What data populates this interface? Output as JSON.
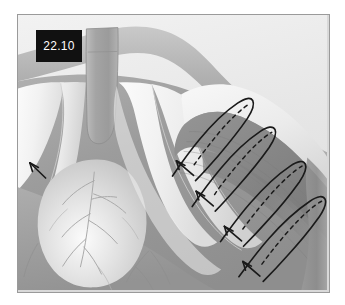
{
  "figure": {
    "label": "22.10",
    "alt_name": "thoracic-anatomy-suture-illustration",
    "frame": {
      "x": 17,
      "y": 14,
      "width": 311,
      "height": 277,
      "border_color": "#9a9a9a"
    },
    "palette": {
      "background": "#ffffff",
      "field_light": "#ececec",
      "field_mid": "#cfcfcf",
      "field_dark": "#9d9d9d",
      "muscle_dark": "#8d8d8d",
      "muscle_darker": "#7e7e7e",
      "bone_white": "#f7f7f7",
      "bone_shadow": "#d2d2d2",
      "heart_light": "#e8e8e8",
      "heart_mid": "#bdbdbd",
      "vessel_line": "#a6a6a6",
      "suture_ink": "#1a1a1a",
      "label_bg": "#111111",
      "label_fg": "#ffffff"
    },
    "structures": [
      {
        "name": "clavicle-manubrium-band",
        "tone": "#b4b4b4"
      },
      {
        "name": "sternum-body",
        "tone": "#ababab"
      },
      {
        "name": "costal-cartilage-left",
        "tone": "#f7f7f7"
      },
      {
        "name": "costal-cartilage-right",
        "tone": "#f4f4f4"
      },
      {
        "name": "heart-silhouette",
        "tone": "#d6d6d6"
      },
      {
        "name": "coronary-vessels",
        "tone": "#a6a6a6"
      },
      {
        "name": "intercostal-muscle-field",
        "tone": "#8d8d8d"
      }
    ],
    "sutures": [
      {
        "name": "suture-loop-1",
        "solid": "M 531 480 L 546 443 C 552 428 561 409 573 392 C 586 373 601 355 615 340 C 634 320 655 302 672 292 C 685 284 694 282 698 287 C 702 292 700 302 692 315 C 683 330 668 350 651 370 C 634 390 617 409 602 424 C 588 438 576 449 566 456",
        "dashed": "M 556 478 C 562 462 572 440 585 420 C 600 397 619 373 637 353 C 655 333 672 317 684 308",
        "arrow": {
          "x": 498,
          "y": 443,
          "rot": -40
        }
      },
      {
        "name": "suture-loop-2",
        "solid": "M 595 568 L 610 532 C 617 515 628 494 642 474 C 657 452 674 431 690 414 C 708 395 726 379 740 370 C 752 363 760 362 763 367 C 767 373 764 384 755 398 C 745 414 729 434 711 455 C 693 476 675 495 659 511 C 645 525 633 535 623 542",
        "dashed": "M 620 566 C 627 549 638 527 652 506 C 668 482 688 457 707 436 C 726 415 743 398 755 389",
        "arrow": {
          "x": 544,
          "y": 531,
          "rot": -40
        }
      },
      {
        "name": "suture-loop-3",
        "solid": "M 680 672 L 696 634 C 703 617 715 595 730 574 C 746 551 764 529 781 511 C 800 491 819 474 834 465 C 847 457 855 456 858 462 C 862 468 859 480 849 495 C 839 511 822 532 803 554 C 784 576 765 596 748 613 C 733 628 720 639 710 646",
        "dashed": "M 706 670 C 713 652 725 629 740 607 C 757 581 778 555 798 533 C 818 511 836 493 849 484",
        "arrow": {
          "x": 628,
          "y": 633,
          "rot": -40
        }
      },
      {
        "name": "suture-loop-4",
        "solid": "M 735 770 L 752 732 C 759 715 771 693 786 672 C 802 649 821 627 838 609 C 857 589 877 572 892 563 C 905 555 913 554 916 560 C 920 566 917 578 907 593 C 897 609 880 631 860 653 C 841 675 822 695 805 712 C 790 727 777 738 767 745",
        "dashed": "M 762 768 C 769 750 781 727 797 705 C 814 679 835 653 856 631 C 876 609 895 591 908 582 ",
        "arrow": {
          "x": 684,
          "y": 731,
          "rot": -40
        }
      }
    ],
    "arrow_markers": [
      {
        "name": "arrow-marker-left-costal",
        "x": 48,
        "y": 449,
        "rot": -30,
        "tail": 46
      },
      {
        "name": "arrow-marker-suture-1",
        "x": 498,
        "y": 443,
        "rot": -40,
        "tail": 40
      },
      {
        "name": "arrow-marker-suture-2",
        "x": 544,
        "y": 531,
        "rot": -40,
        "tail": 40
      },
      {
        "name": "arrow-marker-suture-3",
        "x": 628,
        "y": 633,
        "rot": -40,
        "tail": 40
      },
      {
        "name": "arrow-marker-suture-4",
        "x": 684,
        "y": 731,
        "rot": -40,
        "tail": 40
      }
    ]
  }
}
